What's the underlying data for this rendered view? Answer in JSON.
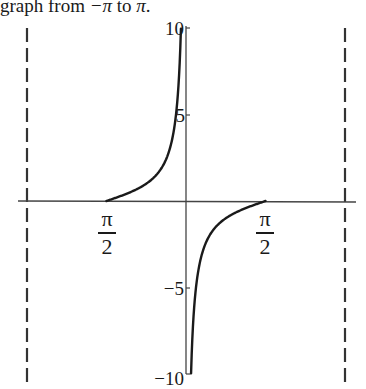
{
  "caption": {
    "prefix": "graph from ",
    "from": "−π",
    "middle": " to ",
    "to": "π",
    "suffix": "."
  },
  "axes": {
    "y_ticks": [
      {
        "value": 10,
        "label": "10"
      },
      {
        "value": 5,
        "label": "5"
      },
      {
        "value": -5,
        "label": "−5"
      },
      {
        "value": -10,
        "label": "−10"
      }
    ],
    "x_ticks": [
      {
        "value": -1.5708,
        "numerator": "π",
        "denominator": "2"
      },
      {
        "value": 1.5708,
        "numerator": "π",
        "denominator": "2"
      }
    ]
  },
  "chart_data": {
    "type": "line",
    "title": "graph from −π to π.",
    "xlabel": "",
    "ylabel": "",
    "xlim": [
      -3.1416,
      3.1416
    ],
    "ylim": [
      -10,
      10
    ],
    "grid": false,
    "legend": null,
    "asymptotes": [
      {
        "x": -3.1416,
        "style": "dashed"
      },
      {
        "x": 3.1416,
        "style": "dashed"
      },
      {
        "x": 0,
        "style": "approached by curve"
      }
    ],
    "x_tick_labels": [
      "π/2 (at x = −π/2)",
      "π/2 (at x = π/2)"
    ],
    "y_tick_labels": [
      "10",
      "5",
      "−5",
      "−10"
    ],
    "series": [
      {
        "name": "left branch",
        "x": [
          -1.5708,
          -1.2,
          -0.9,
          -0.6,
          -0.4,
          -0.3,
          -0.2,
          -0.15,
          -0.1
        ],
        "y": [
          0,
          0.39,
          0.79,
          1.46,
          2.37,
          3.23,
          4.93,
          6.62,
          9.97
        ]
      },
      {
        "name": "right branch",
        "x": [
          0.1,
          0.15,
          0.2,
          0.3,
          0.4,
          0.6,
          0.9,
          1.2,
          1.5708
        ],
        "y": [
          -9.97,
          -6.62,
          -4.93,
          -3.23,
          -2.37,
          -1.46,
          -0.79,
          -0.39,
          0
        ]
      }
    ]
  }
}
